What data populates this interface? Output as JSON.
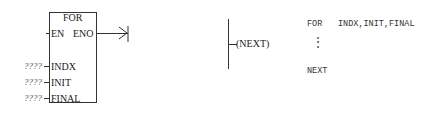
{
  "for_box": {
    "title": "FOR",
    "en": "EN",
    "eno": "ENO",
    "inputs": [
      {
        "name": "INDX",
        "value": "????"
      },
      {
        "name": "INIT",
        "value": "????"
      },
      {
        "name": "FINAL",
        "value": "????"
      }
    ]
  },
  "next_coil": {
    "label": "(NEXT)"
  },
  "stl": {
    "line1_keyword": "FOR",
    "line1_args": "INDX,INIT,FINAL",
    "ellipsis": "⋮",
    "line3": "NEXT"
  }
}
